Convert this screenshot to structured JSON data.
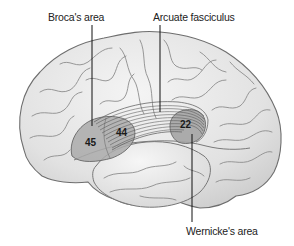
{
  "diagram": {
    "colors": {
      "background": "#ffffff",
      "brain_fill": "#e6e6e6",
      "brain_highlight": "#f2f2f2",
      "sulcus_stroke": "#8a8a8a",
      "outline_stroke": "#6e6e6e",
      "region_fill": "#a9a9a9",
      "fiber_stroke": "#555555",
      "leader_line": "#111111",
      "label_text": "#222222"
    },
    "labels": [
      {
        "id": "broca",
        "text": "Broca's area",
        "x": 48,
        "y": 12
      },
      {
        "id": "arcuate",
        "text": "Arcuate fasciculus",
        "x": 153,
        "y": 12
      },
      {
        "id": "wernicke",
        "text": "Wernicke's area",
        "x": 186,
        "y": 226
      }
    ],
    "region_numbers": [
      {
        "id": "area45",
        "text": "45",
        "x": 85,
        "y": 138
      },
      {
        "id": "area44",
        "text": "44",
        "x": 116,
        "y": 128
      },
      {
        "id": "area22",
        "text": "22",
        "x": 180,
        "y": 120
      }
    ]
  }
}
